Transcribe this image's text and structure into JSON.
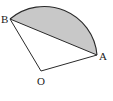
{
  "diagram": {
    "type": "circular-sector-with-shaded-segment",
    "labels": {
      "a": "A",
      "b": "B",
      "o": "O"
    },
    "colors": {
      "stroke": "#2a2a2a",
      "shade": "#c8c8c8"
    }
  }
}
